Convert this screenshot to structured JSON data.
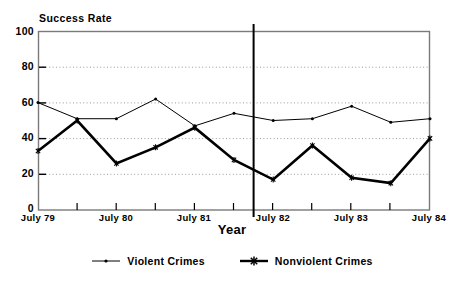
{
  "chart_data": {
    "type": "line",
    "title": "",
    "ylabel": "Success Rate",
    "xlabel": "Year",
    "ylim": [
      0,
      100
    ],
    "yticks": [
      0,
      20,
      40,
      60,
      80,
      100
    ],
    "grid": true,
    "legend_position": "bottom-center",
    "xtick_labels": [
      "July 79",
      "July 80",
      "July 81",
      "July 82",
      "July 83",
      "July 84"
    ],
    "x": [
      0,
      0.5,
      1.0,
      1.5,
      2.0,
      2.5,
      3.0,
      3.5,
      4.0,
      4.5,
      5.0
    ],
    "x_units": "years after July 79 (semiannual points)",
    "annotations": [
      {
        "name": "vertical-divider",
        "type": "vline",
        "x": 2.75
      }
    ],
    "series": [
      {
        "name": "Violent Crimes",
        "marker": "dot",
        "line_weight": "thin",
        "color": "#000000",
        "values": [
          60,
          51,
          51,
          62,
          47,
          54,
          50,
          51,
          58,
          49,
          51
        ]
      },
      {
        "name": "Nonviolent Crimes",
        "marker": "star",
        "line_weight": "thick",
        "color": "#000000",
        "values": [
          33,
          50,
          26,
          35,
          46,
          28,
          17,
          36,
          18,
          15,
          40
        ]
      }
    ]
  },
  "axes": {
    "y_title": "Success Rate",
    "x_title": "Year",
    "y_tick_labels": [
      "100",
      "80",
      "60",
      "40",
      "20",
      "0"
    ],
    "x_tick_labels": [
      "July 79",
      "July 80",
      "July 81",
      "July 82",
      "July 83",
      "July 84"
    ]
  },
  "legend": {
    "items": [
      {
        "label": "Violent Crimes",
        "marker": "dot-marker-icon"
      },
      {
        "label": "Nonviolent Crimes",
        "marker": "star-marker-icon"
      }
    ]
  },
  "colors": {
    "foreground": "#000000",
    "background": "#ffffff",
    "grid": "#b9b9b9",
    "frame": "#6e6e6e"
  }
}
